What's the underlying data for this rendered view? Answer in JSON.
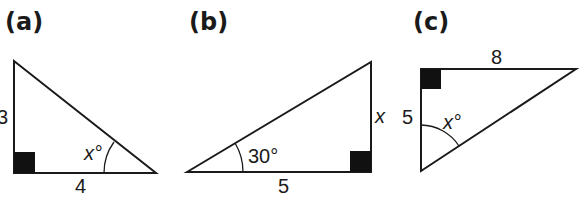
{
  "figure": {
    "panels": [
      {
        "id": "a",
        "label": "(a)",
        "sides": {
          "vertical": "3",
          "horizontal": "4"
        },
        "angle_label": "x°",
        "right_angle_position": "bottom-left"
      },
      {
        "id": "b",
        "label": "(b)",
        "sides": {
          "vertical": "x",
          "horizontal": "5"
        },
        "angle_label": "30°",
        "right_angle_position": "bottom-right"
      },
      {
        "id": "c",
        "label": "(c)",
        "sides": {
          "vertical": "5",
          "horizontal": "8"
        },
        "angle_label": "x°",
        "right_angle_position": "top-left"
      }
    ],
    "colors": {
      "line": "#1a1a1a",
      "background": "#ffffff"
    }
  }
}
